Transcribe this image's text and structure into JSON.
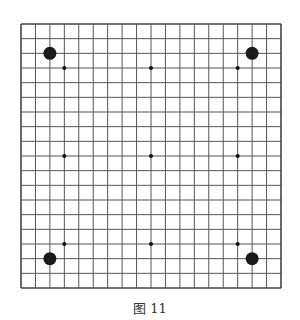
{
  "figure": {
    "caption": "图 11",
    "board_size": 19,
    "line_color": "#555555",
    "border_color": "#444444",
    "stone_color": "#1a1a1a",
    "star_points": [
      [
        3,
        3
      ],
      [
        9,
        3
      ],
      [
        15,
        3
      ],
      [
        3,
        9
      ],
      [
        9,
        9
      ],
      [
        15,
        9
      ],
      [
        3,
        15
      ],
      [
        9,
        15
      ],
      [
        15,
        15
      ]
    ],
    "stones": [
      {
        "col": 2,
        "row": 2,
        "color": "black"
      },
      {
        "col": 16,
        "row": 2,
        "color": "black"
      },
      {
        "col": 2,
        "row": 16,
        "color": "black"
      },
      {
        "col": 16,
        "row": 16,
        "color": "black"
      }
    ]
  }
}
